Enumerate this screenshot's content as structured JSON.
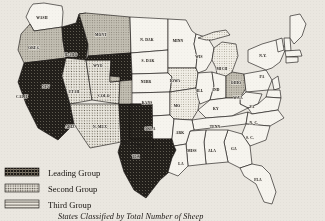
{
  "figure": {
    "caption": "States Classified by Total Number of Sheep",
    "background_color": "#eae7e0",
    "outline_color": "#14110e"
  },
  "legend": {
    "items": [
      {
        "label": "Leading Group",
        "pattern": "dark-crosshatch",
        "color": "#1c1a17"
      },
      {
        "label": "Second Group",
        "pattern": "fine-dots",
        "color": "#b9b4a8"
      },
      {
        "label": "Third Group",
        "pattern": "horizontal-lines",
        "color": "#d5d1c6"
      }
    ]
  },
  "chart_data": {
    "type": "map",
    "title": "States Classified by Total Number of Sheep",
    "categories": [
      "Leading Group",
      "Second Group",
      "Third Group",
      "Unclassified"
    ],
    "legend_position": "bottom-left",
    "states": [
      {
        "label": "WASH",
        "group": "Unclassified",
        "lx": 42,
        "ly": 19
      },
      {
        "label": "OREG",
        "group": "Second Group",
        "lx": 34,
        "ly": 49
      },
      {
        "label": "IDAHO",
        "group": "Leading Group",
        "lx": 71,
        "ly": 56
      },
      {
        "label": "MONT",
        "group": "Second Group",
        "lx": 101,
        "ly": 36
      },
      {
        "label": "N. DAK",
        "group": "Unclassified",
        "lx": 147,
        "ly": 41
      },
      {
        "label": "S. DAK",
        "group": "Unclassified",
        "lx": 148,
        "ly": 62
      },
      {
        "label": "MINN",
        "group": "Unclassified",
        "lx": 178,
        "ly": 42
      },
      {
        "label": "WIS",
        "group": "Unclassified",
        "lx": 199,
        "ly": 58
      },
      {
        "label": "MICH",
        "group": "Third Group",
        "lx": 222,
        "ly": 70
      },
      {
        "label": "NEV",
        "group": "Second Group",
        "lx": 46,
        "ly": 88
      },
      {
        "label": "UTAH",
        "group": "Second Group",
        "lx": 74,
        "ly": 93
      },
      {
        "label": "WYO",
        "group": "Leading Group",
        "lx": 98,
        "ly": 67
      },
      {
        "label": "NEBR",
        "group": "Unclassified",
        "lx": 146,
        "ly": 83
      },
      {
        "label": "IOWA",
        "group": "Third Group",
        "lx": 175,
        "ly": 82
      },
      {
        "label": "ILL",
        "group": "Unclassified",
        "lx": 200,
        "ly": 92
      },
      {
        "label": "IND",
        "group": "Unclassified",
        "lx": 216,
        "ly": 91
      },
      {
        "label": "OHIO",
        "group": "Second Group",
        "lx": 236,
        "ly": 84
      },
      {
        "label": "PA",
        "group": "Unclassified",
        "lx": 262,
        "ly": 78
      },
      {
        "label": "N.Y.",
        "group": "Unclassified",
        "lx": 263,
        "ly": 57
      },
      {
        "label": "CALIF",
        "group": "Leading Group",
        "lx": 22,
        "ly": 98
      },
      {
        "label": "COLO",
        "group": "Second Group",
        "lx": 104,
        "ly": 97
      },
      {
        "label": "KANS",
        "group": "Unclassified",
        "lx": 147,
        "ly": 104
      },
      {
        "label": "MO",
        "group": "Third Group",
        "lx": 177,
        "ly": 107
      },
      {
        "label": "KY",
        "group": "Unclassified",
        "lx": 216,
        "ly": 110
      },
      {
        "label": "ARIZ",
        "group": "Second Group",
        "lx": 70,
        "ly": 128
      },
      {
        "label": "N. MEX",
        "group": "Leading Group",
        "lx": 100,
        "ly": 128
      },
      {
        "label": "OKLA",
        "group": "Unclassified",
        "lx": 150,
        "ly": 130
      },
      {
        "label": "ARK",
        "group": "Unclassified",
        "lx": 180,
        "ly": 134
      },
      {
        "label": "TENN",
        "group": "Unclassified",
        "lx": 215,
        "ly": 128
      },
      {
        "label": "N. C.",
        "group": "Unclassified",
        "lx": 254,
        "ly": 124
      },
      {
        "label": "S. C.",
        "group": "Unclassified",
        "lx": 250,
        "ly": 139
      },
      {
        "label": "MISS",
        "group": "Unclassified",
        "lx": 192,
        "ly": 152
      },
      {
        "label": "ALA",
        "group": "Unclassified",
        "lx": 212,
        "ly": 152
      },
      {
        "label": "GA",
        "group": "Unclassified",
        "lx": 234,
        "ly": 150
      },
      {
        "label": "LA",
        "group": "Unclassified",
        "lx": 181,
        "ly": 165
      },
      {
        "label": "TEX",
        "group": "Leading Group",
        "lx": 136,
        "ly": 158
      },
      {
        "label": "FLA",
        "group": "Unclassified",
        "lx": 258,
        "ly": 181
      },
      {
        "label": "VA",
        "group": "Unclassified",
        "lx": 252,
        "ly": 108
      },
      {
        "label": "W.VA",
        "group": "Unclassified",
        "lx": 238,
        "ly": 99
      }
    ]
  }
}
